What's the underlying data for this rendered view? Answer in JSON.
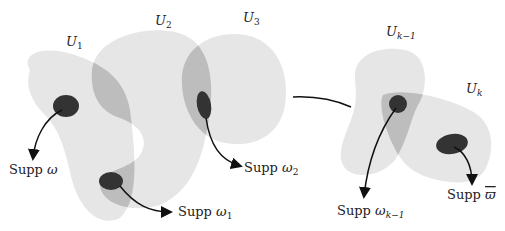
{
  "diagram": {
    "colors": {
      "set_fill": "#e6e6e6",
      "overlap_fill": "#bdbdbd",
      "support_fill": "#333333",
      "arrow": "#111111",
      "text": "#222222"
    },
    "set_labels": {
      "u1": {
        "base": "U",
        "sub": "1"
      },
      "u2": {
        "base": "U",
        "sub": "2"
      },
      "u3": {
        "base": "U",
        "sub": "3"
      },
      "ukm1": {
        "base": "U",
        "sub": "k−1"
      },
      "uk": {
        "base": "U",
        "sub": "k"
      }
    },
    "support_labels": {
      "omega": {
        "prefix": "Supp ",
        "sym": "ω",
        "sub": ""
      },
      "omega1": {
        "prefix": "Supp ",
        "sym": "ω",
        "sub": "1"
      },
      "omega2": {
        "prefix": "Supp ",
        "sym": "ω",
        "sub": "2"
      },
      "omegakm1": {
        "prefix": "Supp ",
        "sym": "ω",
        "sub": "k−1"
      },
      "omegabar": {
        "prefix": "Supp ",
        "sym": "ϖ",
        "sub": ""
      }
    }
  }
}
